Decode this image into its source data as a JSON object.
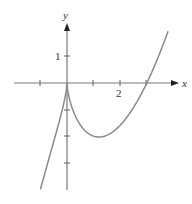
{
  "chart_data": {
    "type": "line",
    "title": "",
    "xlabel": "x",
    "ylabel": "y",
    "function": "y = x^(2/3)(x - 3)",
    "xlim": [
      -1.9,
      4.2
    ],
    "ylim": [
      -4.0,
      2.2
    ],
    "x_ticks": [
      -1,
      1,
      2,
      3
    ],
    "y_ticks": [
      1,
      -1,
      -2,
      -3
    ],
    "x_tick_labels": [
      {
        "value": 2,
        "label": "2"
      }
    ],
    "y_tick_labels": [
      {
        "value": 1,
        "label": "1"
      }
    ],
    "grid": false,
    "legend": null,
    "annotations": [],
    "series": [
      {
        "name": "curve",
        "x": [
          -1,
          -0.75,
          -0.5,
          -0.25,
          0,
          0.25,
          0.5,
          0.75,
          1,
          1.2,
          1.5,
          2,
          2.5,
          3,
          3.5,
          3.8
        ],
        "y": [
          -4,
          -3.11,
          -2.21,
          -1.29,
          0,
          -1.09,
          -1.57,
          -1.86,
          -2,
          -2.03,
          -1.97,
          -1.59,
          -0.92,
          0,
          1.15,
          1.95
        ]
      }
    ],
    "key_points": {
      "cusp": [
        0,
        0
      ],
      "local_min": [
        1.2,
        -2.03
      ],
      "x_intercept": [
        3,
        0
      ]
    }
  },
  "axes": {
    "x_label": "x",
    "y_label": "y",
    "x_tick_label_2": "2",
    "y_tick_label_1": "1"
  }
}
